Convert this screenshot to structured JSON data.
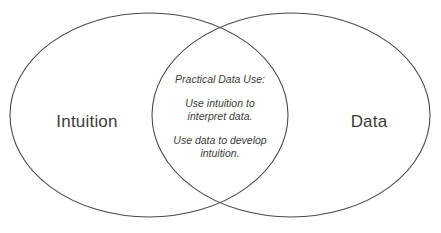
{
  "diagram": {
    "type": "venn",
    "sets": 2,
    "background_color": "#ffffff",
    "stroke_color": "#4a4a4a",
    "stroke_width": 1.1,
    "text_color": "#3b3b3b",
    "left_set": {
      "label": "Intuition",
      "center_x": 149,
      "center_y": 115,
      "radius_x": 139,
      "radius_y": 102,
      "label_x": 87,
      "label_y": 122
    },
    "right_set": {
      "label": "Data",
      "center_x": 291,
      "center_y": 115,
      "radius_x": 139,
      "radius_y": 102,
      "label_x": 369,
      "label_y": 122
    },
    "intersection": {
      "heading": "Practical Data Use:",
      "blocks": [
        {
          "lines": [
            "Use intuition to",
            "interpret data."
          ]
        },
        {
          "lines": [
            "Use data to develop",
            "intuition."
          ]
        }
      ],
      "center_x": 220,
      "center_y": 116
    }
  }
}
